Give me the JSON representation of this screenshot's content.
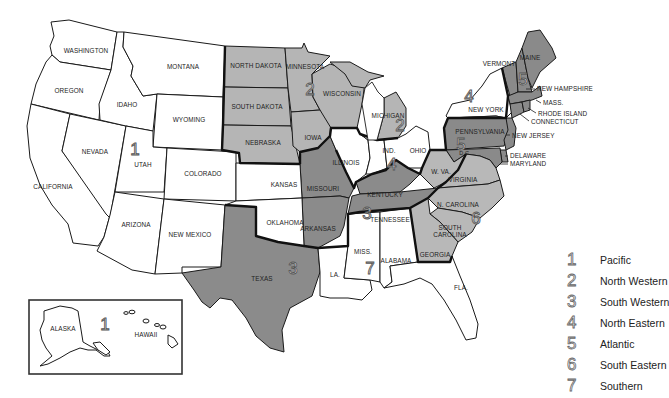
{
  "colors": {
    "region_1": "#ffffff",
    "region_2": "#b5b5b5",
    "region_3": "#8b8b8b",
    "region_4": "#ffffff",
    "region_5": "#8a8a8a",
    "region_6": "#b8b8b8",
    "region_7": "#ffffff",
    "border": "#1a1a1a",
    "background": "#ffffff"
  },
  "states": {
    "washington": "WASHINGTON",
    "oregon": "OREGON",
    "california": "CALIFORNIA",
    "nevada": "NEVADA",
    "idaho": "IDAHO",
    "montana": "MONTANA",
    "wyoming": "WYOMING",
    "utah": "UTAH",
    "colorado": "COLORADO",
    "arizona": "ARIZONA",
    "new_mexico": "NEW MEXICO",
    "north_dakota": "NORTH DAKOTA",
    "south_dakota": "SOUTH DAKOTA",
    "nebraska": "NEBRASKA",
    "kansas": "KANSAS",
    "oklahoma": "OKLAHOMA",
    "texas": "TEXAS",
    "minnesota": "MINNESOTA",
    "iowa": "IOWA",
    "missouri": "MISSOURI",
    "arkansas": "ARKANSAS",
    "louisiana": "LA.",
    "wisconsin": "WISCONSIN",
    "illinois": "ILLINOIS",
    "michigan": "MICHIGAN",
    "indiana": "IND.",
    "ohio": "OHIO",
    "kentucky": "KENTUCKY",
    "tennessee": "TENNESSEE",
    "mississippi": "MISS.",
    "alabama": "ALABAMA",
    "georgia": "GEORGIA",
    "florida": "FLA.",
    "south_carolina_1": "SOUTH",
    "south_carolina_2": "CAROLINA",
    "north_carolina": "N. CAROLINA",
    "virginia": "VIRGINIA",
    "west_virginia": "W. VA.",
    "pennsylvania": "PENNSYLVANIA",
    "new_york": "NEW YORK",
    "vermont": "VERMONT",
    "maine": "MAINE",
    "new_hampshire": "NEW HAMPSHIRE",
    "massachusetts": "MASS.",
    "rhode_island": "RHODE ISLAND",
    "connecticut": "CONNECTICUT",
    "new_jersey": "NEW JERSEY",
    "delaware": "DELAWARE",
    "maryland": "MARYLAND",
    "dc": "D.C.",
    "alaska": "ALASKA",
    "hawaii": "HAWAII"
  },
  "region_markers": {
    "utah_1": "1",
    "inset_1": "1",
    "minnesota_2": "2",
    "michigan_2": "2",
    "texas_3": "3",
    "tennessee_3": "3",
    "new_york_4": "4",
    "indiana_4": "4",
    "new_england_5": "5",
    "pennsylvania_5": "5",
    "carolina_6": "6",
    "mississippi_7": "7"
  },
  "legend": {
    "items": [
      {
        "number": "1",
        "label": "Pacific"
      },
      {
        "number": "2",
        "label": "North Western"
      },
      {
        "number": "3",
        "label": "South Western"
      },
      {
        "number": "4",
        "label": "North Eastern"
      },
      {
        "number": "5",
        "label": "Atlantic"
      },
      {
        "number": "6",
        "label": "South Eastern"
      },
      {
        "number": "7",
        "label": "Southern"
      }
    ]
  }
}
